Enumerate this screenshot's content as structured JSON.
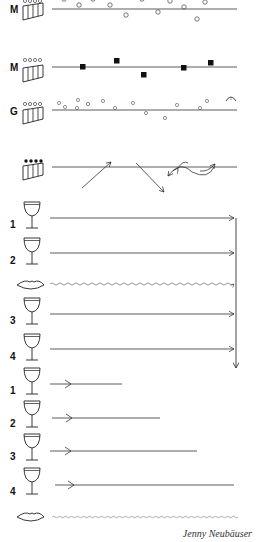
{
  "signature": "Jenny Neubäuser",
  "colors": {
    "ink": "#222222",
    "background": "#ffffff"
  },
  "staves": [
    {
      "label": "M",
      "instrument_icon": "panpipe-icon",
      "holes": "open",
      "notation": "open-circles",
      "y": 9
    },
    {
      "label": "M",
      "instrument_icon": "panpipe-icon",
      "holes": "open",
      "notation": "filled-squares",
      "y": 67
    },
    {
      "label": "G",
      "instrument_icon": "panpipe-icon",
      "holes": "open",
      "notation": "small-open-circles-with-fermata",
      "y": 110
    },
    {
      "label": "",
      "instrument_icon": "panpipe-icon",
      "holes": "filled",
      "notation": "diagonal-arrows-and-wavy-double-arrow",
      "y": 167
    }
  ],
  "glass_section_1": {
    "rows": [
      {
        "label": "1",
        "icon": "wine-glass-icon",
        "line": "arrow-to-end"
      },
      {
        "label": "2",
        "icon": "wine-glass-icon",
        "line": "arrow-to-end"
      },
      {
        "label": "",
        "icon": "lips-icon",
        "line": "wavy"
      },
      {
        "label": "3",
        "icon": "wine-glass-icon",
        "line": "arrow-to-end"
      },
      {
        "label": "4",
        "icon": "wine-glass-icon",
        "line": "arrow-to-end"
      }
    ],
    "connector": "vertical-arrow-down"
  },
  "glass_section_2": {
    "rows": [
      {
        "label": "1",
        "icon": "wine-glass-icon",
        "line": "short-arrow"
      },
      {
        "label": "2",
        "icon": "wine-glass-icon",
        "line": "short-arrow"
      },
      {
        "label": "3",
        "icon": "wine-glass-icon",
        "line": "short-arrow"
      },
      {
        "label": "4",
        "icon": "wine-glass-icon",
        "line": "short-arrow"
      },
      {
        "label": "",
        "icon": "lips-icon",
        "line": "wavy"
      }
    ]
  }
}
